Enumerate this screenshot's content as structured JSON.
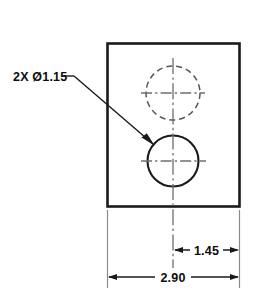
{
  "drawing": {
    "title": "Plate with two holes — orthographic view",
    "background_color": "#ffffff",
    "line_color": "#1a1a1a",
    "hidden_line_color": "#55555a",
    "centerline_color": "#6e6e74",
    "extension_line_color": "#8a8a90",
    "units_note": "",
    "annotations": {
      "hole_callout": "2X Ø1.15",
      "hole_callout_plain": "2X O1.15"
    },
    "dimensions": [
      {
        "id": "hole-center-to-right-edge",
        "value": "1.45",
        "orientation": "horizontal",
        "arrow_style": "inward"
      },
      {
        "id": "overall-width",
        "value": "2.90",
        "orientation": "horizontal",
        "arrow_style": "inward"
      }
    ],
    "features": {
      "plate": {
        "name": "rectangular-plate",
        "edge_style": "solid"
      },
      "hole_near": {
        "name": "through-hole-visible",
        "diameter_label": "Ø1.15",
        "edge_style": "solid"
      },
      "hole_far": {
        "name": "through-hole-hidden",
        "diameter_label": "Ø1.15",
        "edge_style": "dashed"
      }
    }
  }
}
